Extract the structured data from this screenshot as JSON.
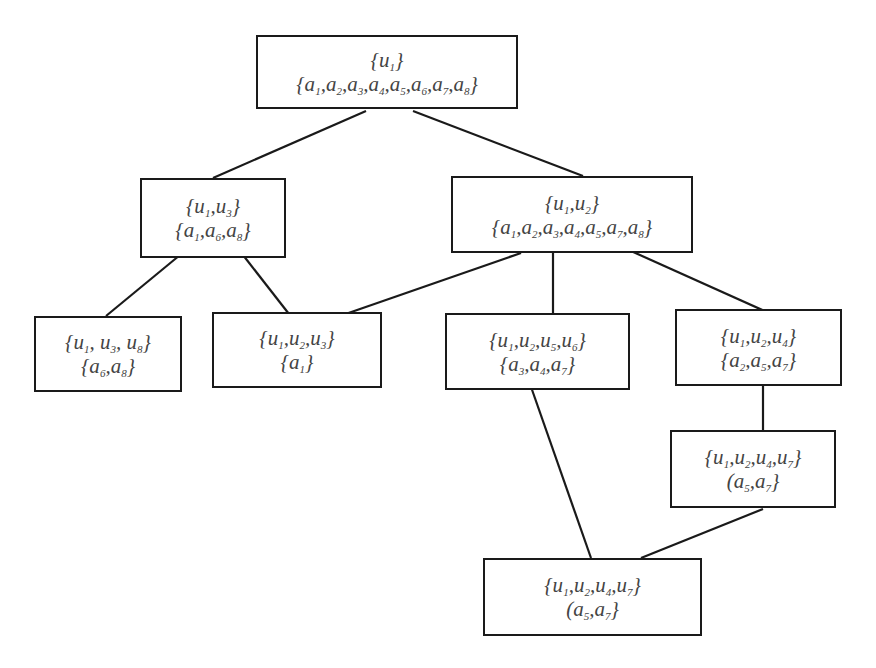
{
  "diagram": {
    "type": "concept-lattice",
    "colors": {
      "stroke": "#1a1a1a",
      "text": "#444444",
      "background": "#ffffff"
    },
    "nodes": [
      {
        "id": "n1",
        "box": [
          256,
          35,
          262,
          74
        ],
        "line1": [
          [
            "{u",
            "1",
            "}"
          ]
        ],
        "line2": [
          [
            "{a",
            "1",
            ","
          ],
          [
            "a",
            "2",
            ","
          ],
          [
            "a",
            "3",
            ","
          ],
          [
            "a",
            "4",
            ","
          ],
          [
            "a",
            "5",
            ","
          ],
          [
            "a",
            "6",
            ","
          ],
          [
            "a",
            "7",
            ","
          ],
          [
            "a",
            "8",
            "}"
          ]
        ],
        "objects": "{u1}",
        "attributes": "{a1,a2,a3,a4,a5,a6,a7,a8}"
      },
      {
        "id": "n2",
        "box": [
          140,
          178,
          146,
          80
        ],
        "line1": [
          [
            "{u",
            "1",
            ","
          ],
          [
            "u",
            "3",
            "}"
          ]
        ],
        "line2": [
          [
            "{a",
            "1",
            ","
          ],
          [
            "a",
            "6",
            ","
          ],
          [
            "a",
            "8",
            "}"
          ]
        ],
        "objects": "{u1,u3}",
        "attributes": "{a1,a6,a8}"
      },
      {
        "id": "n3",
        "box": [
          451,
          176,
          242,
          77
        ],
        "line1": [
          [
            "{u",
            "1",
            ","
          ],
          [
            "u",
            "2",
            "}"
          ]
        ],
        "line2": [
          [
            "{a",
            "1",
            ","
          ],
          [
            "a",
            "2",
            ","
          ],
          [
            "a",
            "3",
            ","
          ],
          [
            "a",
            "4",
            ","
          ],
          [
            "a",
            "5",
            ","
          ],
          [
            "a",
            "7",
            ","
          ],
          [
            "a",
            "8",
            "}"
          ]
        ],
        "objects": "{u1,u2}",
        "attributes": "{a1,a2,a3,a4,a5,a7,a8}"
      },
      {
        "id": "n4",
        "box": [
          34,
          316,
          148,
          76
        ],
        "line1": [
          [
            "{u",
            "1",
            ", "
          ],
          [
            "u",
            "3",
            ", "
          ],
          [
            "u",
            "8",
            "}"
          ]
        ],
        "line2": [
          [
            "{a",
            "6",
            ","
          ],
          [
            "a",
            "8",
            "}"
          ]
        ],
        "objects": "{u1, u3, u8}",
        "attributes": "{a6,a8}"
      },
      {
        "id": "n5",
        "box": [
          212,
          312,
          170,
          76
        ],
        "line1": [
          [
            "{u",
            "1",
            ","
          ],
          [
            "u",
            "2",
            ","
          ],
          [
            "u",
            "3",
            "}"
          ]
        ],
        "line2": [
          [
            "{a",
            "1",
            "}"
          ]
        ],
        "objects": "{u1,u2,u3}",
        "attributes": "{a1}"
      },
      {
        "id": "n6",
        "box": [
          445,
          313,
          185,
          77
        ],
        "line1": [
          [
            "{u",
            "1",
            ","
          ],
          [
            "u",
            "2",
            ","
          ],
          [
            "u",
            "5",
            ","
          ],
          [
            "u",
            "6",
            "}"
          ]
        ],
        "line2": [
          [
            "{a",
            "3",
            ","
          ],
          [
            "a",
            "4",
            ","
          ],
          [
            "a",
            "7",
            "}"
          ]
        ],
        "objects": "{u1,u2,u5,u6}",
        "attributes": "{a3,a4,a7}"
      },
      {
        "id": "n7",
        "box": [
          675,
          309,
          167,
          77
        ],
        "line1": [
          [
            "{u",
            "1",
            ","
          ],
          [
            "u",
            "2",
            ","
          ],
          [
            "u",
            "4",
            "}"
          ]
        ],
        "line2": [
          [
            "{a",
            "2",
            ","
          ],
          [
            "a",
            "5",
            ","
          ],
          [
            "a",
            "7",
            "}"
          ]
        ],
        "objects": "{u1,u2,u4}",
        "attributes": "{a2,a5,a7}"
      },
      {
        "id": "n8",
        "box": [
          670,
          430,
          166,
          78
        ],
        "line1": [
          [
            "{u",
            "1",
            ","
          ],
          [
            "u",
            "2",
            ","
          ],
          [
            "u",
            "4",
            ","
          ],
          [
            "u",
            "7",
            "}"
          ]
        ],
        "line2": [
          [
            "(a",
            "5",
            ","
          ],
          [
            "a",
            "7",
            "}"
          ]
        ],
        "objects": "{u1,u2,u4,u7}",
        "attributes": "(a5,a7}"
      },
      {
        "id": "n9",
        "box": [
          483,
          558,
          219,
          78
        ],
        "line1": [
          [
            "{u",
            "1",
            ","
          ],
          [
            "u",
            "2",
            ","
          ],
          [
            "u",
            "4",
            ","
          ],
          [
            "u",
            "7",
            "}"
          ]
        ],
        "line2": [
          [
            "(a",
            "5",
            ","
          ],
          [
            "a",
            "7",
            "}"
          ]
        ],
        "objects": "{u1,u2,u4,u7}",
        "attributes": "(a5,a7}"
      }
    ],
    "edges": [
      {
        "from": "n1",
        "to": "n2",
        "points": [
          366,
          111,
          213,
          178
        ]
      },
      {
        "from": "n1",
        "to": "n3",
        "points": [
          413,
          111,
          583,
          176
        ]
      },
      {
        "from": "n2",
        "to": "n4",
        "points": [
          180,
          255,
          106,
          316
        ]
      },
      {
        "from": "n2",
        "to": "n5",
        "points": [
          243,
          255,
          289,
          314
        ]
      },
      {
        "from": "n3",
        "to": "n5",
        "points": [
          521,
          253,
          337,
          317
        ]
      },
      {
        "from": "n3",
        "to": "n6",
        "points": [
          553,
          250,
          553,
          313
        ]
      },
      {
        "from": "n3",
        "to": "n7",
        "points": [
          631,
          251,
          769,
          313
        ]
      },
      {
        "from": "n7",
        "to": "n8",
        "points": [
          763,
          386,
          763,
          430
        ]
      },
      {
        "from": "n6",
        "to": "n9",
        "points": [
          530,
          384,
          591,
          558
        ]
      },
      {
        "from": "n8",
        "to": "n9",
        "points": [
          763,
          509,
          641,
          558
        ]
      }
    ]
  }
}
